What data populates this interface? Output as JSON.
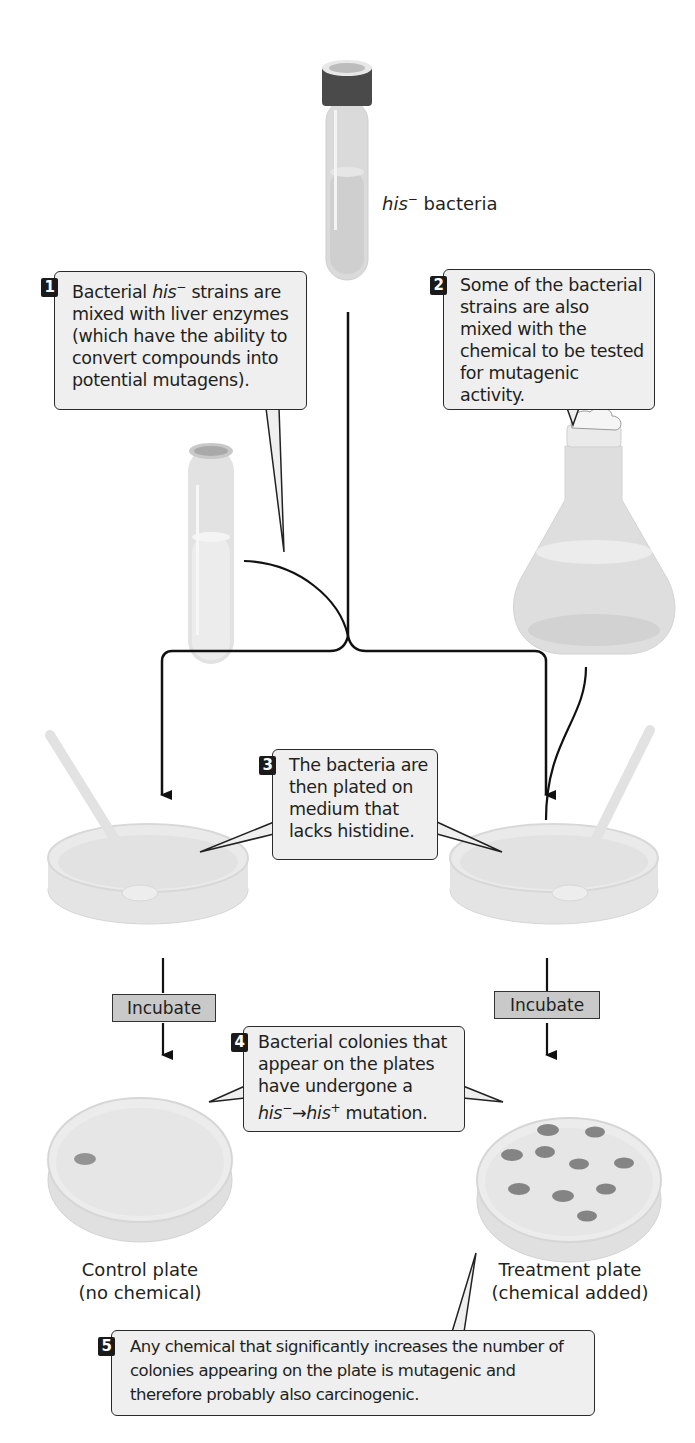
{
  "title_label": {
    "italic": "his",
    "sup": "−",
    "rest": " bacteria"
  },
  "steps": [
    {
      "number": "1",
      "parts": {
        "pre": "Bacterial ",
        "italic": "his",
        "sup": "−",
        "post": " strains are mixed with liver enzymes (which have the ability to convert compounds into potential mutagens)."
      }
    },
    {
      "number": "2",
      "text": "Some of the bacterial strains are also mixed with the chemical to be tested for mutagenic activity."
    },
    {
      "number": "3",
      "text": "The bacteria are then plated on medium that lacks histidine."
    },
    {
      "number": "4",
      "parts": {
        "pre": "Bacterial colonies that appear on the plates have undergone a ",
        "italic1": "his",
        "sup1": "−",
        "arrow": "→",
        "italic2": "his",
        "sup2": "+",
        "post": " mutation."
      }
    },
    {
      "number": "5",
      "text": "Any chemical that significantly increases the number of colonies appearing on the plate is mutagenic and therefore probably also carcinogenic."
    }
  ],
  "incubate_label": "Incubate",
  "plates": {
    "control": {
      "line1": "Control plate",
      "line2": "(no chemical)",
      "colony_count": 1
    },
    "treatment": {
      "line1": "Treatment plate",
      "line2": "(chemical added)",
      "colony_count": 10
    }
  },
  "colors": {
    "callout_bg": "#efefef",
    "step_badge": "#1a1a1a",
    "incubate_bg": "#c9c9c9",
    "glass": "#dcdcdc",
    "cap": "#4a4a4a"
  }
}
